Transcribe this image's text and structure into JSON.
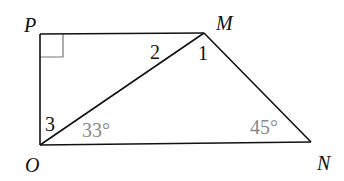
{
  "diagram": {
    "type": "geometry-quadrilateral",
    "vertices": [
      {
        "id": "P",
        "label": "P",
        "x": 40,
        "y": 34
      },
      {
        "id": "M",
        "label": "M",
        "x": 204,
        "y": 33
      },
      {
        "id": "N",
        "label": "N",
        "x": 311,
        "y": 142
      },
      {
        "id": "O",
        "label": "O",
        "x": 40,
        "y": 145
      }
    ],
    "segments": [
      "PM",
      "MN",
      "NO",
      "OP",
      "OM"
    ],
    "right_angle_at": "P",
    "angle_labels": {
      "angle1": "1",
      "angle2": "2",
      "angle3": "3",
      "angle_O": "33°",
      "angle_N": "45°"
    },
    "colors": {
      "line": "#111111",
      "given_angle_text": "#8a8a8a",
      "right_angle_mark": "#777777"
    }
  }
}
